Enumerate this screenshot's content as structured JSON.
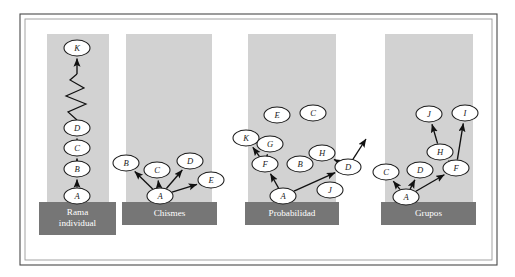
{
  "figure": {
    "background_color": "#ffffff",
    "frame_color": "#4a4a4a",
    "column_color": "#d2d2d2",
    "label_box_color": "#767676",
    "label_text_color": "#ffffff",
    "node_fill_color": "#ffffff",
    "node_stroke_color": "#1a1a1a",
    "edge_color": "#111111"
  },
  "panels": [
    {
      "id": "rama-individual",
      "label": "Rama individual",
      "label_lines": [
        "Rama",
        "individual"
      ],
      "column": {
        "x": 47,
        "y": 34,
        "width": 62,
        "height": 168
      },
      "label_box": {
        "x": 39,
        "y": 202,
        "width": 77,
        "height": 33
      },
      "nodes": [
        {
          "id": "A",
          "label": "A",
          "cx": 77,
          "cy": 196,
          "rx": 13,
          "ry": 8
        },
        {
          "id": "B",
          "label": "B",
          "cx": 77,
          "cy": 169,
          "rx": 13,
          "ry": 8
        },
        {
          "id": "C",
          "label": "C",
          "cx": 77,
          "cy": 148,
          "rx": 13,
          "ry": 8
        },
        {
          "id": "D",
          "label": "D",
          "cx": 77,
          "cy": 128,
          "rx": 13,
          "ry": 8
        },
        {
          "id": "K",
          "label": "K",
          "cx": 77,
          "cy": 48,
          "rx": 13,
          "ry": 8
        }
      ],
      "edges": [
        {
          "from": "A",
          "to": "B"
        },
        {
          "from": "B",
          "to": "C"
        },
        {
          "from": "C",
          "to": "D"
        },
        {
          "from": "D",
          "to": "K"
        }
      ],
      "squiggle": {
        "description": "zigzag elision between D and K",
        "points": "77,120 68,112 86,104 66,96 84,88 70,80 77,74"
      }
    },
    {
      "id": "chismes",
      "label": "Chismes",
      "label_lines": [
        "Chismes"
      ],
      "column": {
        "x": 126,
        "y": 34,
        "width": 86,
        "height": 168
      },
      "label_box": {
        "x": 122,
        "y": 202,
        "width": 95,
        "height": 23
      },
      "nodes": [
        {
          "id": "A",
          "label": "A",
          "cx": 160,
          "cy": 196,
          "rx": 13,
          "ry": 8
        },
        {
          "id": "B",
          "label": "B",
          "cx": 126,
          "cy": 163,
          "rx": 13,
          "ry": 8
        },
        {
          "id": "C",
          "label": "C",
          "cx": 157,
          "cy": 170,
          "rx": 13,
          "ry": 8
        },
        {
          "id": "D",
          "label": "D",
          "cx": 190,
          "cy": 161,
          "rx": 13,
          "ry": 8
        },
        {
          "id": "E",
          "label": "E",
          "cx": 211,
          "cy": 180,
          "rx": 13,
          "ry": 8
        }
      ],
      "edges": [
        {
          "from": "A",
          "to": "B"
        },
        {
          "from": "A",
          "to": "C"
        },
        {
          "from": "A",
          "to": "D"
        },
        {
          "from": "A",
          "to": "E"
        }
      ]
    },
    {
      "id": "probabilidad",
      "label": "Probabilidad",
      "label_lines": [
        "Probabilidad"
      ],
      "column": {
        "x": 248,
        "y": 34,
        "width": 88,
        "height": 168
      },
      "label_box": {
        "x": 245,
        "y": 202,
        "width": 94,
        "height": 23
      },
      "nodes": [
        {
          "id": "A",
          "label": "A",
          "cx": 283,
          "cy": 196,
          "rx": 13,
          "ry": 8
        },
        {
          "id": "F",
          "label": "F",
          "cx": 265,
          "cy": 164,
          "rx": 13,
          "ry": 8
        },
        {
          "id": "K",
          "label": "K",
          "cx": 246,
          "cy": 138,
          "rx": 13,
          "ry": 8
        },
        {
          "id": "G",
          "label": "G",
          "cx": 270,
          "cy": 144,
          "rx": 13,
          "ry": 8
        },
        {
          "id": "E",
          "label": "E",
          "cx": 277,
          "cy": 115,
          "rx": 13,
          "ry": 8
        },
        {
          "id": "C",
          "label": "C",
          "cx": 313,
          "cy": 113,
          "rx": 13,
          "ry": 8
        },
        {
          "id": "B",
          "label": "B",
          "cx": 300,
          "cy": 164,
          "rx": 13,
          "ry": 8
        },
        {
          "id": "H",
          "label": "H",
          "cx": 322,
          "cy": 153,
          "rx": 13,
          "ry": 8
        },
        {
          "id": "D",
          "label": "D",
          "cx": 348,
          "cy": 167,
          "rx": 13,
          "ry": 8
        },
        {
          "id": "J",
          "label": "J",
          "cx": 330,
          "cy": 190,
          "rx": 13,
          "ry": 8
        }
      ],
      "edges": [
        {
          "from": "A",
          "to": "F"
        },
        {
          "from": "A",
          "to": "D"
        },
        {
          "from": "F",
          "to": "K"
        },
        {
          "from": "F",
          "to": "G"
        },
        {
          "from": "D",
          "to": "H"
        }
      ],
      "open_edges": [
        {
          "from": "D",
          "to_point": {
            "x": 366,
            "y": 139
          }
        }
      ],
      "isolated_nodes": [
        "E",
        "C",
        "B",
        "J"
      ]
    },
    {
      "id": "grupos",
      "label": "Grupos",
      "label_lines": [
        "Grupos"
      ],
      "column": {
        "x": 385,
        "y": 34,
        "width": 88,
        "height": 168
      },
      "label_box": {
        "x": 381,
        "y": 202,
        "width": 95,
        "height": 23
      },
      "nodes": [
        {
          "id": "A",
          "label": "A",
          "cx": 406,
          "cy": 197,
          "rx": 13,
          "ry": 8
        },
        {
          "id": "C",
          "label": "C",
          "cx": 386,
          "cy": 172,
          "rx": 13,
          "ry": 8
        },
        {
          "id": "D",
          "label": "D",
          "cx": 420,
          "cy": 170,
          "rx": 13,
          "ry": 8
        },
        {
          "id": "F",
          "label": "F",
          "cx": 456,
          "cy": 168,
          "rx": 13,
          "ry": 8
        },
        {
          "id": "H",
          "label": "H",
          "cx": 440,
          "cy": 152,
          "rx": 13,
          "ry": 8
        },
        {
          "id": "J",
          "label": "J",
          "cx": 429,
          "cy": 114,
          "rx": 13,
          "ry": 8
        },
        {
          "id": "I",
          "label": "I",
          "cx": 465,
          "cy": 113,
          "rx": 13,
          "ry": 8
        }
      ],
      "edges": [
        {
          "from": "A",
          "to": "C"
        },
        {
          "from": "A",
          "to": "D"
        },
        {
          "from": "A",
          "to": "F"
        },
        {
          "from": "F",
          "to": "H"
        },
        {
          "from": "F",
          "to": "I"
        },
        {
          "from": "H",
          "to": "J"
        }
      ]
    }
  ],
  "frame": {
    "outer": {
      "x": 20,
      "y": 14,
      "width": 477,
      "height": 251
    },
    "inner": {
      "x": 25,
      "y": 19,
      "width": 467,
      "height": 241
    }
  }
}
